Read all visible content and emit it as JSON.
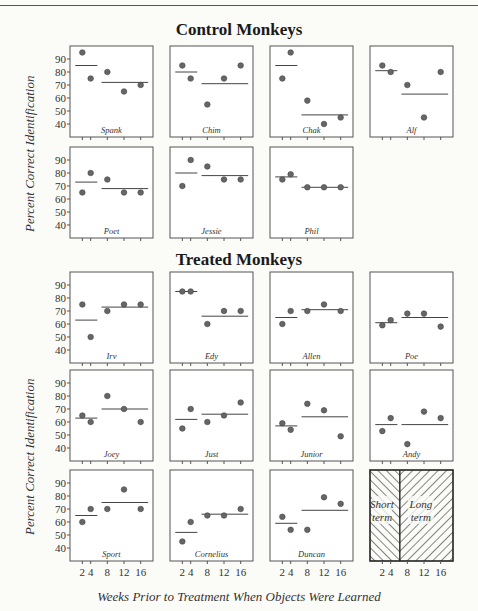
{
  "header_rule": true,
  "sections": {
    "control_title": "Control Monkeys",
    "treated_title": "Treated Monkeys"
  },
  "axes": {
    "ylabel": "Percent Correct Identification",
    "xlabel": "Weeks Prior to Treatment When Objects Were Learned",
    "yticks": [
      40,
      50,
      60,
      70,
      80,
      90
    ],
    "xticks": [
      2,
      4,
      8,
      12,
      16
    ]
  },
  "legend": {
    "short_label_1": "Short",
    "short_label_2": "term",
    "long_label_1": "Long",
    "long_label_2": "term"
  },
  "chart_data": {
    "type": "scatter",
    "xlabel": "Weeks Prior to Treatment When Objects Were Learned",
    "ylabel": "Percent Correct Identification",
    "x": [
      2,
      4,
      8,
      12,
      16
    ],
    "ylim": [
      30,
      100
    ],
    "grid": false,
    "groups": [
      {
        "name": "Control Monkeys",
        "panels": [
          {
            "name": "Spank",
            "values": [
              95,
              75,
              80,
              65,
              70
            ],
            "short_mean": 85,
            "long_mean": 72
          },
          {
            "name": "Chim",
            "values": [
              85,
              75,
              55,
              75,
              85
            ],
            "short_mean": 80,
            "long_mean": 71
          },
          {
            "name": "Chak",
            "values": [
              75,
              95,
              58,
              40,
              45
            ],
            "short_mean": 85,
            "long_mean": 47
          },
          {
            "name": "Alf",
            "values": [
              85,
              80,
              70,
              45,
              80
            ],
            "short_mean": 81,
            "long_mean": 63
          },
          {
            "name": "Poet",
            "values": [
              65,
              80,
              75,
              65,
              65
            ],
            "short_mean": 73,
            "long_mean": 68
          },
          {
            "name": "Jessie",
            "values": [
              70,
              90,
              85,
              75,
              75
            ],
            "short_mean": 80,
            "long_mean": 78
          },
          {
            "name": "Phil",
            "values": [
              75,
              79,
              69,
              69,
              69
            ],
            "short_mean": 77,
            "long_mean": 69
          }
        ]
      },
      {
        "name": "Treated Monkeys",
        "panels": [
          {
            "name": "Irv",
            "values": [
              75,
              50,
              70,
              75,
              75
            ],
            "short_mean": 63,
            "long_mean": 73
          },
          {
            "name": "Edy",
            "values": [
              85,
              85,
              60,
              70,
              70
            ],
            "short_mean": 85,
            "long_mean": 66
          },
          {
            "name": "Allen",
            "values": [
              60,
              70,
              70,
              75,
              70
            ],
            "short_mean": 65,
            "long_mean": 71
          },
          {
            "name": "Poe",
            "values": [
              59,
              63,
              68,
              68,
              58
            ],
            "short_mean": 61,
            "long_mean": 65
          },
          {
            "name": "Joey",
            "values": [
              65,
              60,
              80,
              70,
              60
            ],
            "short_mean": 63,
            "long_mean": 70
          },
          {
            "name": "Just",
            "values": [
              55,
              70,
              60,
              65,
              75
            ],
            "short_mean": 62,
            "long_mean": 66
          },
          {
            "name": "Junior",
            "values": [
              59,
              54,
              74,
              69,
              49
            ],
            "short_mean": 57,
            "long_mean": 64
          },
          {
            "name": "Andy",
            "values": [
              53,
              63,
              43,
              68,
              63
            ],
            "short_mean": 58,
            "long_mean": 58
          },
          {
            "name": "Sport",
            "values": [
              60,
              70,
              70,
              85,
              70
            ],
            "short_mean": 65,
            "long_mean": 75
          },
          {
            "name": "Cornelius",
            "values": [
              45,
              60,
              65,
              65,
              70
            ],
            "short_mean": 52,
            "long_mean": 66
          },
          {
            "name": "Duncan",
            "values": [
              64,
              54,
              54,
              79,
              74
            ],
            "short_mean": 59,
            "long_mean": 69
          }
        ]
      }
    ]
  }
}
